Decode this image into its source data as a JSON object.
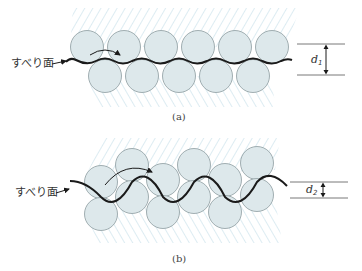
{
  "colors": {
    "hatch": "#a9d0df",
    "circle_fill": "#dde8eb",
    "circle_stroke": "#8d9ca0",
    "slip_line": "#1a1a1a",
    "dimension_line": "#555555"
  },
  "panel_a": {
    "caption": "(a)",
    "slip_label": "すべり面",
    "dimension_label": "d",
    "dimension_subscript": "1",
    "circle_radius": 16.5,
    "top_row": [
      [
        87,
        47
      ],
      [
        124,
        47
      ],
      [
        161,
        47
      ],
      [
        198,
        47
      ],
      [
        235,
        47
      ],
      [
        272,
        47
      ]
    ],
    "bottom_row": [
      [
        105,
        76
      ],
      [
        142,
        76
      ],
      [
        179,
        76
      ],
      [
        216,
        76
      ],
      [
        253,
        76
      ]
    ]
  },
  "panel_b": {
    "caption": "(b)",
    "slip_label": "すべり面",
    "dimension_label": "d",
    "dimension_subscript": "2",
    "circle_radius": 16.5,
    "circles": [
      [
        101,
        182
      ],
      [
        101,
        214
      ],
      [
        132,
        165
      ],
      [
        132,
        197
      ],
      [
        163,
        180
      ],
      [
        163,
        212
      ],
      [
        194,
        165
      ],
      [
        194,
        197
      ],
      [
        225,
        180
      ],
      [
        225,
        212
      ],
      [
        257,
        163
      ],
      [
        257,
        195
      ]
    ]
  }
}
